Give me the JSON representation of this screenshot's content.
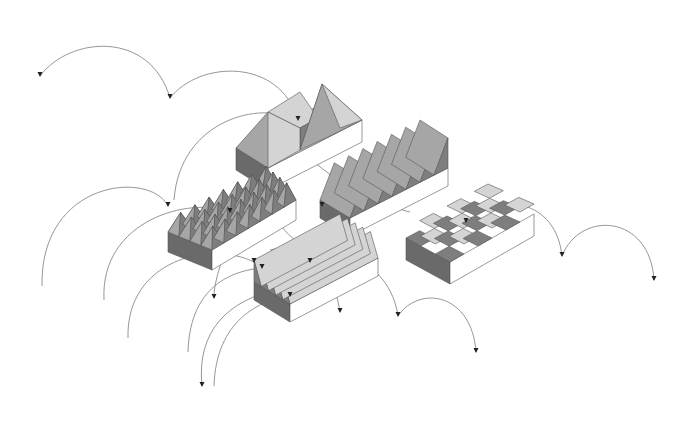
{
  "diagram": {
    "type": "isometric roof-form study with trajectory arcs",
    "background": "#ffffff",
    "colors": {
      "light": "#d4d4d4",
      "mid": "#a6a6a6",
      "dark": "#7e7e7e",
      "side_dark": "#6a6a6a",
      "side_white": "#ffffff",
      "arc": "#8a8a8a",
      "arrow": "#222222"
    },
    "blocks": [
      {
        "name": "hip-roof-block",
        "base": {
          "top": [
            [
              236,
              148
            ],
            [
              330,
              100
            ],
            [
              362,
              120
            ],
            [
              268,
              168
            ]
          ],
          "depth": 22
        },
        "faces": [
          {
            "pts": [
              [
                236,
                148
              ],
              [
                268,
                112
              ],
              [
                300,
                128
              ],
              [
                268,
                168
              ]
            ],
            "tone": "mid"
          },
          {
            "pts": [
              [
                268,
                112
              ],
              [
                300,
                92
              ],
              [
                318,
                118
              ],
              [
                300,
                128
              ]
            ],
            "tone": "light"
          },
          {
            "pts": [
              [
                300,
                128
              ],
              [
                318,
                118
              ],
              [
                322,
                84
              ],
              [
                300,
                150
              ]
            ],
            "tone": "dark"
          },
          {
            "pts": [
              [
                268,
                112
              ],
              [
                300,
                128
              ],
              [
                300,
                150
              ],
              [
                268,
                168
              ]
            ],
            "tone": "light"
          },
          {
            "pts": [
              [
                322,
                84
              ],
              [
                362,
                120
              ],
              [
                330,
                136
              ],
              [
                300,
                150
              ]
            ],
            "tone": "mid"
          },
          {
            "pts": [
              [
                322,
                84
              ],
              [
                362,
                120
              ],
              [
                340,
                128
              ]
            ],
            "tone": "light"
          }
        ]
      },
      {
        "name": "pyramid-grid-block",
        "base": {
          "top": [
            [
              168,
              232
            ],
            [
              270,
              178
            ],
            [
              296,
              200
            ],
            [
              212,
              250
            ]
          ],
          "depth": 20
        },
        "pyramid_rows": 4,
        "pyramid_cols": 7
      },
      {
        "name": "sawtooth-block",
        "base": {
          "top": [
            [
              320,
              200
            ],
            [
              420,
              150
            ],
            [
              448,
              168
            ],
            [
              350,
              218
            ]
          ],
          "depth": 18
        },
        "teeth": 7
      },
      {
        "name": "wave-block",
        "base": {
          "top": [
            [
              406,
              238
            ],
            [
              488,
              194
            ],
            [
              534,
              214
            ],
            [
              450,
              262
            ]
          ],
          "depth": 22
        },
        "cells_rows": 3,
        "cells_cols": 6
      },
      {
        "name": "zigzag-block",
        "base": {
          "top": [
            [
              254,
              282
            ],
            [
              340,
              236
            ],
            [
              378,
              258
            ],
            [
              290,
              304
            ]
          ],
          "depth": 18
        },
        "zigs": 5
      }
    ],
    "arcs": [
      {
        "d": "M40,76 C70,36 150,30 170,98",
        "arrow": [
          170,
          98
        ]
      },
      {
        "d": "M170,98 C200,60 280,58 298,120",
        "arrow": [
          40,
          76
        ]
      },
      {
        "d": "M174,200 C180,120 260,100 298,120",
        "arrow": [
          298,
          120
        ]
      },
      {
        "d": "M42,286 C40,180 150,170 168,206",
        "arrow": [
          168,
          206
        ]
      },
      {
        "d": "M104,300 C100,220 190,196 230,212",
        "arrow": [
          230,
          212
        ]
      },
      {
        "d": "M128,338 C126,260 210,240 254,262",
        "arrow": [
          254,
          262
        ]
      },
      {
        "d": "M230,212 C234,240 214,270 214,298",
        "arrow": [
          214,
          298
        ]
      },
      {
        "d": "M188,352 C190,280 240,270 262,268",
        "arrow": [
          262,
          268
        ]
      },
      {
        "d": "M202,386 C196,330 230,300 276,290",
        "arrow": [
          202,
          386
        ]
      },
      {
        "d": "M214,386 C216,320 260,300 290,296",
        "arrow": [
          290,
          296
        ]
      },
      {
        "d": "M262,268 C300,250 330,250 340,312",
        "arrow": [
          340,
          312
        ]
      },
      {
        "d": "M270,250 C330,236 390,260 398,316",
        "arrow": [
          398,
          316
        ]
      },
      {
        "d": "M398,316 C420,284 472,294 476,352",
        "arrow": [
          476,
          352
        ]
      },
      {
        "d": "M322,206 C330,176 380,150 414,160",
        "arrow": [
          322,
          206
        ]
      },
      {
        "d": "M466,222 C500,190 556,200 562,256",
        "arrow": [
          562,
          256
        ]
      },
      {
        "d": "M562,256 C580,210 650,214 654,280",
        "arrow": [
          654,
          280
        ]
      },
      {
        "d": "M300,150 C330,176 360,200 410,212",
        "arrow": [
          466,
          222
        ]
      },
      {
        "d": "M260,180 C280,260 340,262 378,258",
        "arrow": [
          310,
          262
        ]
      }
    ]
  }
}
